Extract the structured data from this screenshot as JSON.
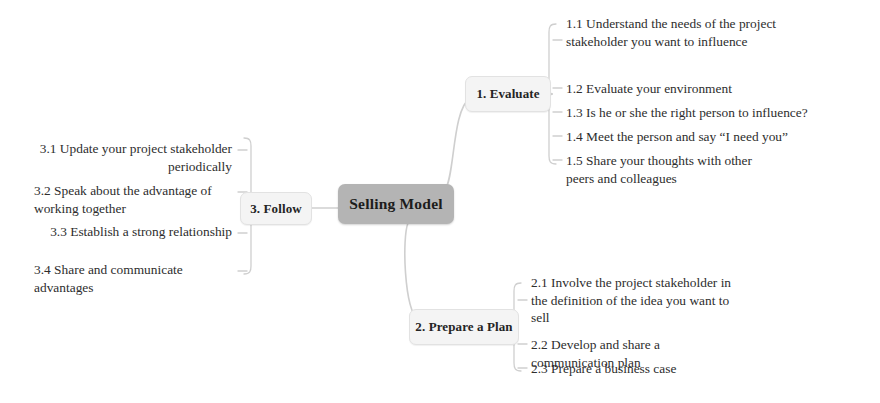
{
  "diagram": {
    "title": "Selling Model",
    "center": {
      "label": "Selling Model"
    },
    "branches": [
      {
        "id": "evaluate",
        "label": "1. Evaluate",
        "side": "right",
        "items": [
          {
            "id": "1-1",
            "text": "1.1 Understand the needs of the project stakeholder you want to influence"
          },
          {
            "id": "1-2",
            "text": "1.2 Evaluate your environment"
          },
          {
            "id": "1-3",
            "text": "1.3 Is he or she the right person to influence?"
          },
          {
            "id": "1-4",
            "text": "1.4 Meet the person and say “I need you”"
          },
          {
            "id": "1-5",
            "text": "1.5 Share your thoughts with other peers and colleagues"
          }
        ]
      },
      {
        "id": "prepare-a-plan",
        "label": "2. Prepare a Plan",
        "side": "right",
        "items": [
          {
            "id": "2-1",
            "text": "2.1 Involve the project stakeholder in the definition of the idea you want to sell"
          },
          {
            "id": "2-2",
            "text": "2.2 Develop and share a communication plan"
          },
          {
            "id": "2-3",
            "text": "2.3 Prepare a business case"
          }
        ]
      },
      {
        "id": "follow",
        "label": "3. Follow",
        "side": "left",
        "items": [
          {
            "id": "3-1",
            "text": "3.1 Update your project stakeholder periodically"
          },
          {
            "id": "3-2",
            "text": "3.2 Speak about the advantage of working together"
          },
          {
            "id": "3-3",
            "text": "3.3 Establish a strong relationship"
          },
          {
            "id": "3-4",
            "text": "3.4 Share and communicate advantages"
          }
        ]
      }
    ],
    "colors": {
      "center_fill": "#b4b4b4",
      "branch_fill": "#f4f4f4",
      "branch_border": "#e2e2e2",
      "connector": "#cfcfcf",
      "text": "#2d2d2d",
      "background": "#ffffff"
    }
  }
}
